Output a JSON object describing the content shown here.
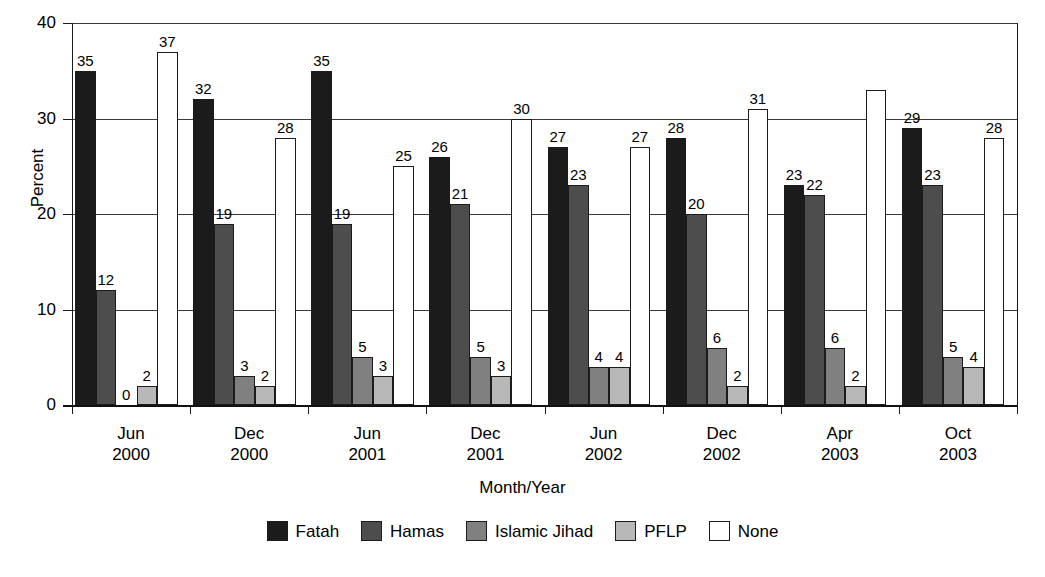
{
  "chart_data": {
    "type": "bar",
    "title": "",
    "xlabel": "Month/Year",
    "ylabel": "Percent",
    "ylim": [
      0,
      40
    ],
    "yticks": [
      0,
      10,
      20,
      30,
      40
    ],
    "grid": true,
    "legend_position": "bottom",
    "categories": [
      "Jun 2000",
      "Dec 2000",
      "Jun 2001",
      "Dec 2001",
      "Jun 2002",
      "Dec 2002",
      "Apr 2003",
      "Oct 2003"
    ],
    "category_lines": [
      {
        "line1": "Jun",
        "line2": "2000"
      },
      {
        "line1": "Dec",
        "line2": "2000"
      },
      {
        "line1": "Jun",
        "line2": "2001"
      },
      {
        "line1": "Dec",
        "line2": "2001"
      },
      {
        "line1": "Jun",
        "line2": "2002"
      },
      {
        "line1": "Dec",
        "line2": "2002"
      },
      {
        "line1": "Apr",
        "line2": "2003"
      },
      {
        "line1": "Oct",
        "line2": "2003"
      }
    ],
    "series": [
      {
        "name": "Fatah",
        "color": "#1b1b1b",
        "values": [
          35,
          32,
          35,
          26,
          27,
          28,
          23,
          29
        ],
        "labels": [
          "35",
          "32",
          "35",
          "26",
          "27",
          "28",
          "23",
          "29"
        ]
      },
      {
        "name": "Hamas",
        "color": "#4d4d4d",
        "values": [
          12,
          19,
          19,
          21,
          23,
          20,
          22,
          23
        ],
        "labels": [
          "12",
          "19",
          "19",
          "21",
          "23",
          "20",
          "22",
          "23"
        ]
      },
      {
        "name": "Islamic Jihad",
        "color": "#808080",
        "values": [
          0,
          3,
          5,
          5,
          4,
          6,
          6,
          5
        ],
        "labels": [
          "0",
          "3",
          "5",
          "5",
          "4",
          "6",
          "6",
          "5"
        ]
      },
      {
        "name": "PFLP",
        "color": "#b8b8b8",
        "values": [
          2,
          2,
          3,
          3,
          4,
          2,
          2,
          4
        ],
        "labels": [
          "2",
          "2",
          "3",
          "3",
          "4",
          "2",
          "2",
          "4"
        ]
      },
      {
        "name": "None",
        "color": "#ffffff",
        "values": [
          37,
          28,
          25,
          30,
          27,
          31,
          33,
          28
        ],
        "labels": [
          "37",
          "28",
          "25",
          "30",
          "27",
          "31",
          "",
          "28"
        ]
      }
    ]
  },
  "legend": {
    "items": [
      {
        "label": "Fatah",
        "color": "#1b1b1b"
      },
      {
        "label": "Hamas",
        "color": "#4d4d4d"
      },
      {
        "label": "Islamic Jihad",
        "color": "#808080"
      },
      {
        "label": "PFLP",
        "color": "#b8b8b8"
      },
      {
        "label": "None",
        "color": "#ffffff"
      }
    ]
  },
  "axes": {
    "y_title": "Percent",
    "x_title": "Month/Year",
    "y_tick_labels": [
      "40",
      "30",
      "20",
      "10",
      "0"
    ]
  }
}
